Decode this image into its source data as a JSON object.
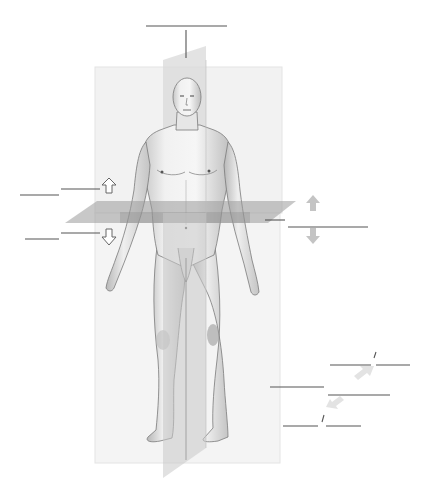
{
  "diagram": {
    "colors": {
      "background": "#ffffff",
      "frontal_plane": "#f1f1f1",
      "frontal_plane_edge": "#e2e2e2",
      "sagittal_plane": "#c9c9c9",
      "transverse_plane": "#9a9a9a",
      "skin_light": "#f3f3f3",
      "skin_shade": "#bdbdbd",
      "outline": "#6b6b6b",
      "label_line": "#555555",
      "arrow_outline": "#666666",
      "arrow_fill_grey": "#c4c4c4",
      "arrow_fill_light": "#e6e6e6"
    },
    "planes": [
      {
        "id": "frontal",
        "name": "frontal-plane"
      },
      {
        "id": "sagittal",
        "name": "sagittal-plane"
      },
      {
        "id": "transverse",
        "name": "transverse-plane"
      }
    ],
    "label_blanks": [
      {
        "id": "top",
        "x1": 146,
        "y1": 26,
        "x2": 227,
        "y2": 26,
        "leader": [
          186,
          30,
          186,
          58
        ]
      },
      {
        "id": "left-upper-a",
        "x1": 20,
        "y1": 195,
        "x2": 59,
        "y2": 195
      },
      {
        "id": "left-upper-b",
        "x1": 61,
        "y1": 189,
        "x2": 100,
        "y2": 189
      },
      {
        "id": "left-lower-a",
        "x1": 25,
        "y1": 239,
        "x2": 59,
        "y2": 239
      },
      {
        "id": "left-lower-b",
        "x1": 61,
        "y1": 233,
        "x2": 100,
        "y2": 233
      },
      {
        "id": "right-transverse",
        "x1": 288,
        "y1": 227,
        "x2": 368,
        "y2": 227,
        "leader": [
          265,
          220,
          285,
          220
        ]
      },
      {
        "id": "right-foot-1a",
        "x1": 330,
        "y1": 365,
        "x2": 371,
        "y2": 365
      },
      {
        "id": "right-foot-1b",
        "x1": 376,
        "y1": 365,
        "x2": 410,
        "y2": 365
      },
      {
        "id": "right-foot-2",
        "x1": 270,
        "y1": 387,
        "x2": 324,
        "y2": 387
      },
      {
        "id": "right-foot-3",
        "x1": 328,
        "y1": 395,
        "x2": 390,
        "y2": 395
      },
      {
        "id": "right-foot-4a",
        "x1": 283,
        "y1": 426,
        "x2": 318,
        "y2": 426
      },
      {
        "id": "right-foot-4b",
        "x1": 326,
        "y1": 426,
        "x2": 361,
        "y2": 426
      }
    ],
    "arrows": [
      {
        "id": "superior-left",
        "direction": "up",
        "style": "outline",
        "cx": 109,
        "cy": 186
      },
      {
        "id": "inferior-left",
        "direction": "down",
        "style": "outline",
        "cx": 109,
        "cy": 237
      },
      {
        "id": "superior-right",
        "direction": "up",
        "style": "filled",
        "cx": 313,
        "cy": 203
      },
      {
        "id": "inferior-right",
        "direction": "down",
        "style": "filled",
        "cx": 313,
        "cy": 236
      },
      {
        "id": "proximal-foot",
        "direction": "up-right",
        "style": "light",
        "cx": 363,
        "cy": 373
      },
      {
        "id": "distal-foot",
        "direction": "down-left",
        "style": "light",
        "cx": 335,
        "cy": 404
      }
    ]
  }
}
